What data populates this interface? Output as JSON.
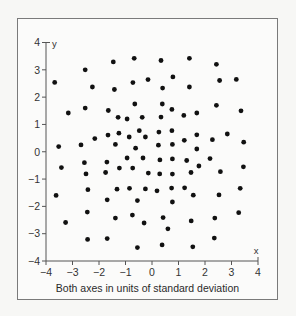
{
  "chart_data": {
    "type": "scatter",
    "title": "",
    "xlabel": "x",
    "ylabel": "y",
    "caption": "Both axes in units of standard deviation",
    "xlim": [
      -4,
      4
    ],
    "ylim": [
      -4,
      4
    ],
    "grid": false,
    "legend": null,
    "x_ticks": [
      -4,
      -3,
      -2,
      -1,
      0,
      1,
      2,
      3,
      4
    ],
    "y_ticks": [
      -4,
      -3,
      -2,
      -1,
      0,
      1,
      2,
      3,
      4
    ],
    "x_tick_labels": [
      "−4",
      "−3",
      "−2",
      "−1",
      "0",
      "1",
      "2",
      "3",
      "4"
    ],
    "y_tick_labels": [
      "−4",
      "−3",
      "−2",
      "−1",
      "0",
      "1",
      "2",
      "3",
      "4"
    ],
    "marker_color": "#111111",
    "points": [
      [
        -3.67,
        2.54
      ],
      [
        -2.52,
        3.0
      ],
      [
        -1.46,
        3.29
      ],
      [
        -0.67,
        3.42
      ],
      [
        0.34,
        3.34
      ],
      [
        1.41,
        3.42
      ],
      [
        2.43,
        3.2
      ],
      [
        -2.25,
        2.37
      ],
      [
        -1.42,
        2.28
      ],
      [
        -0.72,
        2.53
      ],
      [
        -0.15,
        2.64
      ],
      [
        0.79,
        2.74
      ],
      [
        2.55,
        2.61
      ],
      [
        3.18,
        2.65
      ],
      [
        0.4,
        2.33
      ],
      [
        1.41,
        2.37
      ],
      [
        -3.16,
        1.42
      ],
      [
        -2.52,
        1.6
      ],
      [
        -1.65,
        1.51
      ],
      [
        -0.65,
        1.75
      ],
      [
        0.39,
        1.75
      ],
      [
        -1.28,
        1.26
      ],
      [
        -0.94,
        1.2
      ],
      [
        -0.37,
        1.26
      ],
      [
        0.34,
        1.27
      ],
      [
        0.75,
        1.55
      ],
      [
        1.2,
        1.33
      ],
      [
        1.69,
        1.42
      ],
      [
        2.43,
        1.7
      ],
      [
        3.36,
        1.5
      ],
      [
        -1.66,
        0.61
      ],
      [
        -1.25,
        0.68
      ],
      [
        -0.86,
        0.54
      ],
      [
        -0.48,
        0.77
      ],
      [
        -0.25,
        0.54
      ],
      [
        0.26,
        0.72
      ],
      [
        0.75,
        0.77
      ],
      [
        -2.16,
        0.48
      ],
      [
        1.69,
        0.62
      ],
      [
        2.84,
        0.65
      ],
      [
        -3.52,
        0.19
      ],
      [
        -2.68,
        0.25
      ],
      [
        -1.38,
        0.27
      ],
      [
        -0.62,
        0.13
      ],
      [
        0.24,
        0.24
      ],
      [
        0.77,
        0.27
      ],
      [
        1.22,
        0.42
      ],
      [
        1.69,
        0.1
      ],
      [
        2.28,
        0.44
      ],
      [
        3.46,
        0.35
      ],
      [
        -3.42,
        -0.58
      ],
      [
        -2.55,
        -0.4
      ],
      [
        -1.7,
        -0.38
      ],
      [
        -0.94,
        -0.23
      ],
      [
        -0.34,
        -0.23
      ],
      [
        0.3,
        -0.3
      ],
      [
        0.77,
        -0.26
      ],
      [
        1.31,
        -0.32
      ],
      [
        2.19,
        -0.25
      ],
      [
        1.77,
        -0.52
      ],
      [
        3.45,
        -0.55
      ],
      [
        -2.49,
        -0.81
      ],
      [
        -1.75,
        -0.76
      ],
      [
        -1.23,
        -0.6
      ],
      [
        -0.73,
        -0.6
      ],
      [
        -0.14,
        -0.78
      ],
      [
        0.29,
        -0.81
      ],
      [
        0.77,
        -0.82
      ],
      [
        1.47,
        -0.76
      ],
      [
        2.58,
        -0.73
      ],
      [
        -3.62,
        -1.6
      ],
      [
        -2.42,
        -1.39
      ],
      [
        -1.32,
        -1.37
      ],
      [
        -0.85,
        -1.34
      ],
      [
        -0.25,
        -1.36
      ],
      [
        0.19,
        -1.43
      ],
      [
        0.74,
        -1.33
      ],
      [
        1.23,
        -1.32
      ],
      [
        1.56,
        -1.59
      ],
      [
        2.53,
        -1.58
      ],
      [
        3.33,
        -1.34
      ],
      [
        -1.69,
        -1.76
      ],
      [
        -0.55,
        -1.79
      ],
      [
        0.77,
        -1.84
      ],
      [
        -3.26,
        -2.59
      ],
      [
        -2.44,
        -2.21
      ],
      [
        -1.38,
        -2.43
      ],
      [
        -0.74,
        -2.32
      ],
      [
        -0.3,
        -2.61
      ],
      [
        0.42,
        -2.41
      ],
      [
        0.6,
        -2.82
      ],
      [
        1.48,
        -2.53
      ],
      [
        2.37,
        -2.43
      ],
      [
        3.27,
        -2.23
      ],
      [
        -2.43,
        -3.21
      ],
      [
        -1.69,
        -3.18
      ],
      [
        -0.55,
        -3.51
      ],
      [
        0.38,
        -3.41
      ],
      [
        1.54,
        -3.48
      ],
      [
        2.35,
        -3.16
      ]
    ]
  }
}
